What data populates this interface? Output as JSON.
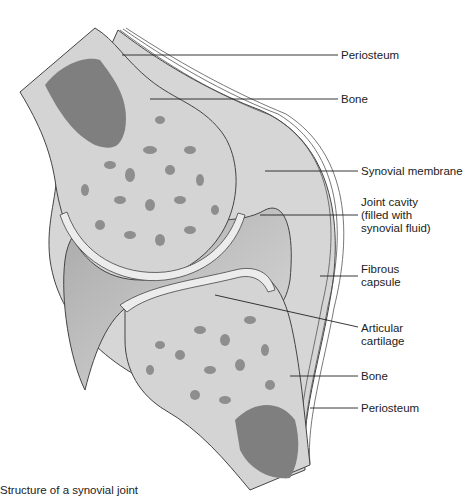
{
  "title": "Structure of a synovial joint",
  "labels": [
    {
      "id": "periosteum-top",
      "text": "Periosteum",
      "x": 341,
      "y": 51
    },
    {
      "id": "bone-top",
      "text": "Bone",
      "x": 341,
      "y": 95
    },
    {
      "id": "synovial-membrane",
      "text": "Synovial membrane",
      "x": 361,
      "y": 167
    },
    {
      "id": "joint-cavity",
      "text": "Joint cavity\n(filled with\nsynovial fluid)",
      "x": 361,
      "y": 200
    },
    {
      "id": "fibrous-capsule",
      "text": "Fibrous\ncapsule",
      "x": 361,
      "y": 266
    },
    {
      "id": "articular-cartilage",
      "text": "Articular\ncartilage",
      "x": 361,
      "y": 324
    },
    {
      "id": "bone-bottom",
      "text": "Bone",
      "x": 361,
      "y": 372
    },
    {
      "id": "periosteum-bottom",
      "text": "Periosteum",
      "x": 361,
      "y": 404
    }
  ],
  "caption": "Structure of a synovial joint",
  "colors": {
    "bone_fill": "#d4d4d4",
    "spongy": "#8e8e8e",
    "marrow": "#7f7f7f",
    "cartilage": "#ececec",
    "cavity": "#c2c2c2",
    "capsule": "#cfcfcf",
    "outline": "#444444"
  }
}
